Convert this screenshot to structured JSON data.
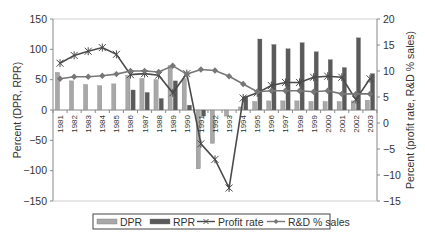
{
  "chart_data": {
    "type": "bar",
    "title": "",
    "categories": [
      "1981",
      "1982",
      "1983",
      "1984",
      "1985",
      "1986",
      "1987",
      "1988",
      "1989",
      "1990",
      "1991",
      "1992",
      "1993",
      "1994",
      "1995",
      "1996",
      "1997",
      "1998",
      "1999",
      "2000",
      "2001",
      "2002",
      "2003"
    ],
    "series": [
      {
        "name": "DPR",
        "type": "bar",
        "axis": "left",
        "color": "#a8a8a8",
        "values": [
          62,
          48,
          42,
          40,
          43,
          57,
          52,
          50,
          73,
          52,
          -97,
          -55,
          -10,
          5,
          14,
          15,
          15,
          15,
          14,
          14,
          14,
          15,
          16
        ]
      },
      {
        "name": "RPR",
        "type": "bar",
        "axis": "left",
        "color": "#5a5a5a",
        "values": [
          0,
          0,
          0,
          0,
          0,
          33,
          29,
          19,
          48,
          8,
          -10,
          0,
          0,
          22,
          117,
          108,
          101,
          111,
          96,
          83,
          70,
          119,
          60
        ]
      },
      {
        "name": "Profit rate",
        "type": "line",
        "axis": "right",
        "marker": "asterisk",
        "color": "#4a4a4a",
        "values": [
          11.5,
          13,
          13.8,
          14.5,
          13.2,
          9.3,
          9.5,
          9.2,
          5.8,
          9.5,
          -4,
          -7,
          -12.5,
          4.8,
          5.8,
          7.2,
          7.8,
          7.8,
          8.8,
          9,
          8.8,
          4.5,
          8.5
        ]
      },
      {
        "name": "R&D % sales",
        "type": "line",
        "axis": "right",
        "marker": "diamond",
        "color": "#777777",
        "values": [
          8.5,
          8.9,
          8.9,
          9.1,
          9.4,
          10,
          10,
          9.8,
          11,
          9.4,
          10.3,
          10.1,
          9,
          7.5,
          6,
          6.2,
          6.2,
          6.2,
          6,
          6.2,
          5.6,
          5.6,
          5.6
        ]
      }
    ],
    "ylabel": "Percent (DPR, RPR)",
    "ylabel_right": "Percent (profit rate, R&D % sales)",
    "xlabel": "",
    "ylim": [
      -150,
      150
    ],
    "yticks": [
      150,
      100,
      50,
      0,
      -50,
      -100,
      -150
    ],
    "ylim_right": [
      -15,
      20
    ],
    "yticks_right": [
      20,
      15,
      10,
      5,
      0,
      -5,
      -10,
      -15
    ],
    "grid": false,
    "legend_position": "bottom"
  },
  "legend": {
    "items": [
      "DPR",
      "RPR",
      "Profit rate",
      "R&D % sales"
    ]
  },
  "axis_labels": {
    "left": "Percent (DPR, RPR)",
    "right": "Percent (profit rate, R&D % sales)"
  }
}
